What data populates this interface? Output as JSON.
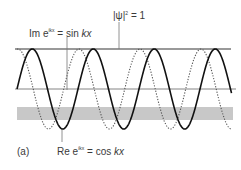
{
  "figure": {
    "panel_label": "(a)",
    "labels": {
      "norm": {
        "prefix": "|ψ|",
        "sup": "2",
        "suffix": " = 1"
      },
      "imag": {
        "prefix": "Im e",
        "sup": "ikx",
        "suffix": " = sin ",
        "italic": "kx"
      },
      "real": {
        "prefix": "Re e",
        "sup": "ikx",
        "suffix": " = cos ",
        "italic": "kx"
      }
    },
    "curves": [
      {
        "name": "cos kx",
        "style": "solid",
        "color": "#111111",
        "phase": "cos"
      },
      {
        "name": "sin kx",
        "style": "dotted",
        "color": "#555555",
        "phase": "sin"
      }
    ],
    "band_color": "#c8c8c8",
    "line_color": "#777777",
    "periods_shown": 3.5
  }
}
